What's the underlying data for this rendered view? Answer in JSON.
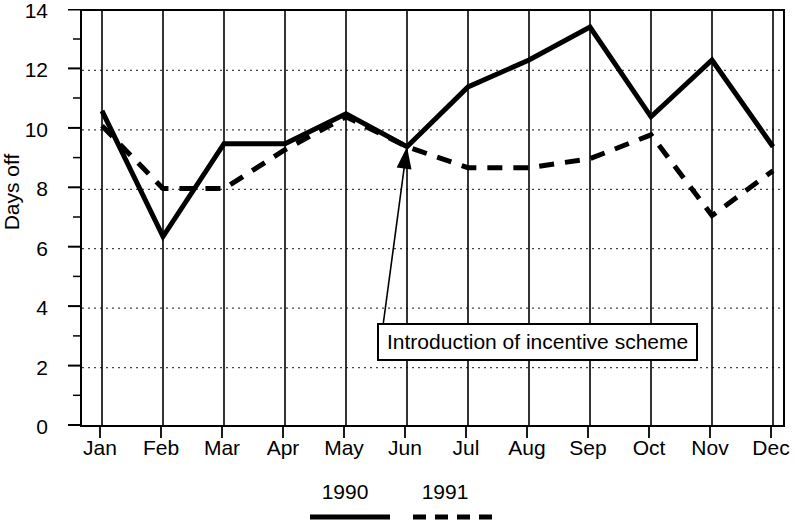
{
  "chart_data": {
    "type": "line",
    "title": "",
    "subtitle": "",
    "xlabel": "",
    "ylabel": "Days off",
    "categories": [
      "Jan",
      "Feb",
      "Mar",
      "Apr",
      "May",
      "Jun",
      "Jul",
      "Aug",
      "Sep",
      "Oct",
      "Nov",
      "Dec"
    ],
    "ylim": [
      0,
      14
    ],
    "yticks": [
      0,
      2,
      4,
      6,
      8,
      10,
      12,
      14
    ],
    "ytick_labels": [
      "0",
      "2",
      "4",
      "6",
      "8",
      "10",
      "12",
      "14"
    ],
    "y_minor_tick_step": 1,
    "grid": "horizontal dotted gridlines at even y values; solid vertical gridline at each month",
    "legend_position": "below plot, centered",
    "series": [
      {
        "name": "1990",
        "style": "solid",
        "values": [
          10.6,
          6.4,
          9.5,
          9.5,
          10.5,
          9.4,
          11.4,
          12.3,
          13.4,
          10.4,
          12.3,
          9.4
        ]
      },
      {
        "name": "1991",
        "style": "dashed",
        "values": [
          10.1,
          8.0,
          8.0,
          9.3,
          10.4,
          9.4,
          8.7,
          8.7,
          9.0,
          9.8,
          7.1,
          8.6
        ]
      }
    ],
    "annotations": [
      {
        "text": "Introduction of incentive scheme",
        "points_to_category": "Jun",
        "points_to_value": 9.4
      }
    ]
  },
  "axis": {
    "y_label": "Days off",
    "y_ticks": [
      "14",
      "12",
      "10",
      "8",
      "6",
      "4",
      "2",
      "0"
    ],
    "x_ticks": [
      "Jan",
      "Feb",
      "Mar",
      "Apr",
      "May",
      "Jun",
      "Jul",
      "Aug",
      "Sep",
      "Oct",
      "Nov",
      "Dec"
    ]
  },
  "legend": {
    "entries": [
      {
        "label": "1990",
        "style": "solid"
      },
      {
        "label": "1991",
        "style": "dashed"
      }
    ]
  },
  "annotation": {
    "text": "Introduction of incentive scheme"
  },
  "colors": {
    "line": "#000000",
    "grid": "#555555",
    "background": "#ffffff"
  }
}
